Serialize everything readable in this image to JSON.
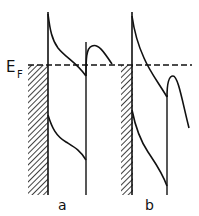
{
  "diagram": {
    "type": "band-diagram",
    "fermi_label": {
      "main": "E",
      "sub": "F"
    },
    "panels": [
      {
        "id": "a",
        "label": "a"
      },
      {
        "id": "b",
        "label": "b"
      }
    ],
    "colors": {
      "ink": "#111111",
      "background": "#ffffff"
    }
  }
}
